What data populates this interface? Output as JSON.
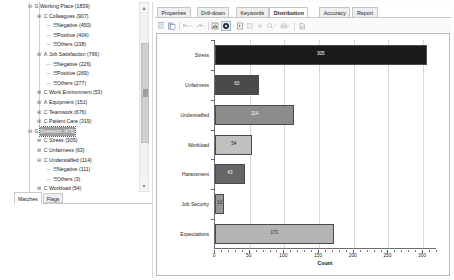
{
  "left": {
    "tree": [
      {
        "indent": 0,
        "toggle": "−",
        "tag": "G",
        "label": "Working Place (1839)",
        "selected": false,
        "leaf": false
      },
      {
        "indent": 1,
        "toggle": "+",
        "tag": "C",
        "label": "Colleagues (907)",
        "selected": false,
        "leaf": false
      },
      {
        "indent": 2,
        "toggle": "",
        "tag": "",
        "label": "Negative (450)",
        "selected": false,
        "leaf": true
      },
      {
        "indent": 2,
        "toggle": "",
        "tag": "",
        "label": "Positive (404)",
        "selected": false,
        "leaf": true
      },
      {
        "indent": 2,
        "toggle": "",
        "tag": "",
        "label": "Others (238)",
        "selected": false,
        "leaf": true
      },
      {
        "indent": 1,
        "toggle": "+",
        "tag": "A",
        "label": "Job Satisfaction (766)",
        "selected": false,
        "leaf": false
      },
      {
        "indent": 2,
        "toggle": "",
        "tag": "",
        "label": "Negative (226)",
        "selected": false,
        "leaf": true
      },
      {
        "indent": 2,
        "toggle": "",
        "tag": "",
        "label": "Positive (269)",
        "selected": false,
        "leaf": true
      },
      {
        "indent": 2,
        "toggle": "",
        "tag": "",
        "label": "Others (277)",
        "selected": false,
        "leaf": true
      },
      {
        "indent": 1,
        "toggle": "+",
        "tag": "C",
        "label": "Work Environment (53)",
        "selected": false,
        "leaf": false
      },
      {
        "indent": 1,
        "toggle": "+",
        "tag": "A",
        "label": "Equipment (151)",
        "selected": false,
        "leaf": false
      },
      {
        "indent": 1,
        "toggle": "+",
        "tag": "C",
        "label": "Teamwork (676)",
        "selected": false,
        "leaf": false
      },
      {
        "indent": 1,
        "toggle": "+",
        "tag": "C",
        "label": "Patient Care (319)",
        "selected": false,
        "leaf": false
      },
      {
        "indent": 0,
        "toggle": "−",
        "tag": "G",
        "label": "Stressors (476)",
        "selected": true,
        "leaf": false
      },
      {
        "indent": 1,
        "toggle": "+",
        "tag": "C",
        "label": "Stress (305)",
        "selected": false,
        "leaf": false
      },
      {
        "indent": 1,
        "toggle": "+",
        "tag": "C",
        "label": "Unfairness (63)",
        "selected": false,
        "leaf": false
      },
      {
        "indent": 1,
        "toggle": "−",
        "tag": "C",
        "label": "Understaffed (114)",
        "selected": false,
        "leaf": false
      },
      {
        "indent": 2,
        "toggle": "",
        "tag": "",
        "label": "Negative (111)",
        "selected": false,
        "leaf": true
      },
      {
        "indent": 2,
        "toggle": "",
        "tag": "",
        "label": "Others (3)",
        "selected": false,
        "leaf": true
      },
      {
        "indent": 1,
        "toggle": "+",
        "tag": "C",
        "label": "Workload (54)",
        "selected": false,
        "leaf": false
      },
      {
        "indent": 1,
        "toggle": "+",
        "tag": "C",
        "label": "Harassment (43)",
        "selected": false,
        "leaf": false
      }
    ],
    "scrollbar": {
      "up": "▲",
      "down": "▼"
    },
    "bottom_tabs": [
      {
        "label": "Matches",
        "active": true
      },
      {
        "label": "Flags",
        "active": false
      }
    ]
  },
  "right": {
    "tabs": [
      {
        "label": "Properties",
        "active": false
      },
      {
        "label": "Drill-down",
        "active": false
      },
      {
        "label": "Keywords",
        "active": false
      },
      {
        "label": "Distribution",
        "active": true
      },
      {
        "label": "Accuracy",
        "active": false
      },
      {
        "label": "Report",
        "active": false
      }
    ],
    "toolbar": [
      {
        "name": "copy-icon"
      },
      {
        "name": "paste-icon"
      },
      {
        "name": "undo-icon"
      },
      {
        "name": "undo-dropdown-icon"
      },
      {
        "name": "redo-icon"
      },
      {
        "name": "redo-dropdown-icon"
      },
      {
        "name": "chart-data-icon"
      },
      {
        "name": "settings-gear-icon"
      },
      {
        "name": "select-pointer-icon"
      },
      {
        "name": "pan-icon"
      },
      {
        "name": "zoom-reset-icon"
      },
      {
        "name": "zoom-icon"
      },
      {
        "name": "zoom-dropdown-icon"
      },
      {
        "name": "print-icon"
      },
      {
        "name": "print-dropdown-icon"
      },
      {
        "name": "export-icon"
      }
    ]
  },
  "chart_data": {
    "type": "bar",
    "orientation": "horizontal",
    "title": "",
    "categories": [
      "Stress",
      "Unfairness",
      "Understaffed",
      "Workload",
      "Harassment",
      "Job Security",
      "Expectations"
    ],
    "values": [
      305,
      63,
      114,
      54,
      43,
      13,
      171
    ],
    "bar_colors": [
      "#1a1a1a",
      "#4a4a4a",
      "#8c8c8c",
      "#c0c0c0",
      "#666666",
      "#989898",
      "#b4b4b4"
    ],
    "value_label_colors": [
      "#ffffff",
      "#ffffff",
      "#ffffff",
      "#222222",
      "#ffffff",
      "#222222",
      "#222222"
    ],
    "xlabel": "Count",
    "ylabel": "",
    "xlim": [
      0,
      320
    ],
    "xticks": [
      0,
      50,
      100,
      150,
      200,
      250,
      300
    ],
    "xticklabels": [
      "0",
      "50",
      "100",
      "150",
      "200",
      "250",
      "300"
    ],
    "grid": true,
    "legend": false
  }
}
